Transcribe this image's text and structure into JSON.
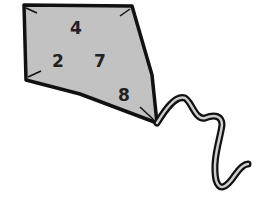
{
  "kite": {
    "fill_color": "#c2c2c2",
    "outline_color": "#111111",
    "numbers": [
      {
        "value": "4",
        "x": 70,
        "y": 20
      },
      {
        "value": "2",
        "x": 52,
        "y": 53
      },
      {
        "value": "7",
        "x": 94,
        "y": 53
      },
      {
        "value": "8",
        "x": 118,
        "y": 87
      }
    ]
  }
}
